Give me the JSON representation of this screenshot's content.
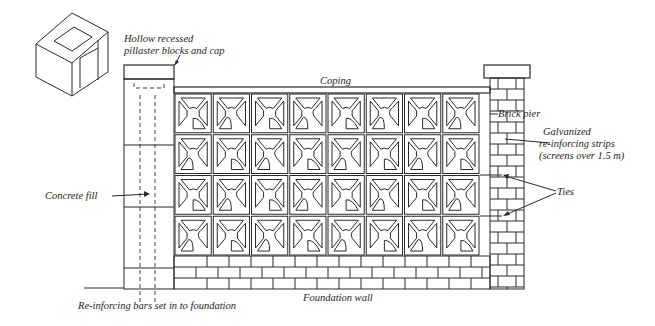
{
  "diagram": {
    "labels": {
      "pilaster": [
        "Hollow recessed",
        "pillaster blocks and cap"
      ],
      "coping": "Coping",
      "brick_pier": "Brick pier",
      "galvanized": [
        "Galvanized",
        "re-inforcing strips",
        "(screens over 1.5 m)"
      ],
      "ties": "Ties",
      "concrete_fill": "Concrete fill",
      "rebar": "Re-inforcing bars set in to foundation",
      "foundation": "Foundation wall"
    },
    "screen_wall": {
      "columns": 8,
      "rows": 4
    },
    "colors": {
      "line": "#2a2a2a",
      "background": "#ffffff"
    }
  }
}
